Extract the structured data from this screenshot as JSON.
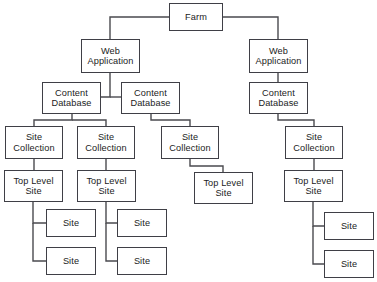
{
  "diagram": {
    "type": "tree",
    "canvas": {
      "width": 377,
      "height": 282
    },
    "style": {
      "background": "#ffffff",
      "box_fill": "#ffffff",
      "box_border": "#3f3f46",
      "text_color": "#1b1b1b",
      "line_color": "#4a4a4f"
    },
    "nodes": [
      {
        "id": "farm",
        "label": "Farm",
        "x": 169,
        "y": 3,
        "w": 54,
        "h": 28,
        "level": 0
      },
      {
        "id": "wa1",
        "label": "Web\nApplication",
        "x": 81,
        "y": 39,
        "w": 59,
        "h": 34,
        "level": 1
      },
      {
        "id": "wa2",
        "label": "Web\nApplication",
        "x": 249,
        "y": 39,
        "w": 59,
        "h": 34,
        "level": 1
      },
      {
        "id": "cdb1",
        "label": "Content\nDatabase",
        "x": 42,
        "y": 82,
        "w": 59,
        "h": 32,
        "level": 2
      },
      {
        "id": "cdb2",
        "label": "Content\nDatabase",
        "x": 121,
        "y": 82,
        "w": 59,
        "h": 32,
        "level": 2
      },
      {
        "id": "cdb3",
        "label": "Content\nDatabase",
        "x": 249,
        "y": 82,
        "w": 59,
        "h": 32,
        "level": 2
      },
      {
        "id": "sc1",
        "label": "Site\nCollection",
        "x": 5,
        "y": 126,
        "w": 58,
        "h": 33,
        "level": 3
      },
      {
        "id": "sc2",
        "label": "Site\nCollection",
        "x": 77,
        "y": 126,
        "w": 58,
        "h": 33,
        "level": 3
      },
      {
        "id": "sc3",
        "label": "Site\nCollection",
        "x": 161,
        "y": 126,
        "w": 58,
        "h": 33,
        "level": 3
      },
      {
        "id": "sc4",
        "label": "Site\nCollection",
        "x": 285,
        "y": 126,
        "w": 58,
        "h": 33,
        "level": 3
      },
      {
        "id": "tls1",
        "label": "Top Level\nSite",
        "x": 4,
        "y": 170,
        "w": 59,
        "h": 32,
        "level": 4
      },
      {
        "id": "tls2",
        "label": "Top Level\nSite",
        "x": 77,
        "y": 170,
        "w": 59,
        "h": 32,
        "level": 4
      },
      {
        "id": "tls3",
        "label": "Top Level\nSite",
        "x": 194,
        "y": 172,
        "w": 59,
        "h": 32,
        "level": 4
      },
      {
        "id": "tls4",
        "label": "Top Level\nSite",
        "x": 284,
        "y": 170,
        "w": 59,
        "h": 32,
        "level": 4
      },
      {
        "id": "site1a",
        "label": "Site",
        "x": 46,
        "y": 209,
        "w": 50,
        "h": 28,
        "level": 5
      },
      {
        "id": "site1b",
        "label": "Site",
        "x": 46,
        "y": 247,
        "w": 50,
        "h": 28,
        "level": 5
      },
      {
        "id": "site2a",
        "label": "Site",
        "x": 117,
        "y": 209,
        "w": 50,
        "h": 28,
        "level": 5
      },
      {
        "id": "site2b",
        "label": "Site",
        "x": 117,
        "y": 247,
        "w": 50,
        "h": 28,
        "level": 5
      },
      {
        "id": "site4a",
        "label": "Site",
        "x": 324,
        "y": 212,
        "w": 50,
        "h": 28,
        "level": 5
      },
      {
        "id": "site4b",
        "label": "Site",
        "x": 324,
        "y": 250,
        "w": 50,
        "h": 28,
        "level": 5
      }
    ],
    "edges": [
      {
        "from": "farm",
        "to": "wa1",
        "path": "M169,17 L110,17 L110,39"
      },
      {
        "from": "farm",
        "to": "wa2",
        "path": "M223,17 L278,17 L278,39"
      },
      {
        "from": "wa1",
        "to": "cdb1",
        "path": "M110,73 L110,97 L101,97"
      },
      {
        "from": "wa1",
        "to": "cdb2",
        "path": "M110,97 L121,97"
      },
      {
        "from": "wa2",
        "to": "cdb3",
        "path": "M278,73 L278,82"
      },
      {
        "from": "cdb1",
        "to": "sc1",
        "path": "M72,114 L72,120 L34,120 L34,126"
      },
      {
        "from": "cdb1",
        "to": "sc2",
        "path": "M72,120 L106,120 L106,126"
      },
      {
        "from": "cdb2",
        "to": "sc3",
        "path": "M151,114 L151,120 L190,120 L190,126"
      },
      {
        "from": "cdb3",
        "to": "sc4",
        "path": "M278,114 L278,120 L314,120 L314,126"
      },
      {
        "from": "sc1",
        "to": "tls1",
        "path": "M34,159 L34,170"
      },
      {
        "from": "sc2",
        "to": "tls2",
        "path": "M106,159 L106,170"
      },
      {
        "from": "sc3",
        "to": "tls3",
        "path": "M190,159 L190,166 L223,166 L223,172"
      },
      {
        "from": "sc4",
        "to": "tls4",
        "path": "M314,159 L314,170"
      },
      {
        "from": "tls1",
        "to": "site1a",
        "path": "M33,202 L33,223 L46,223"
      },
      {
        "from": "tls1",
        "to": "site1b",
        "path": "M33,223 L33,261 L46,261"
      },
      {
        "from": "tls2",
        "to": "site2a",
        "path": "M106,202 L106,223 L117,223"
      },
      {
        "from": "tls2",
        "to": "site2b",
        "path": "M106,223 L106,261 L117,261"
      },
      {
        "from": "tls4",
        "to": "site4a",
        "path": "M313,202 L313,226 L324,226"
      },
      {
        "from": "tls4",
        "to": "site4b",
        "path": "M313,226 L313,264 L324,264"
      }
    ]
  }
}
